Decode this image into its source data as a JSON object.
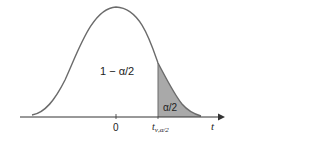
{
  "diagram": {
    "type": "t-distribution-upper-tail",
    "area_center_label": "1 − α/2",
    "area_tail_label": "α/2",
    "origin_label": "0",
    "critical_value_label": {
      "main": "t",
      "subscript": "ν,α/2"
    },
    "axis_label": "t",
    "colors": {
      "curve": "#6b6b6b",
      "axis": "#333333",
      "shade": "#a9a9a9",
      "text": "#222222"
    }
  }
}
